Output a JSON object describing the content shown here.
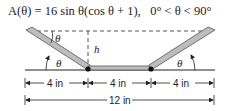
{
  "formula": {
    "lhs": "A(θ) = 16 sin θ(cos θ + 1),",
    "domain": "0° < θ < 90°"
  },
  "diagram": {
    "angle_label": "θ",
    "height_label": "h",
    "segments": [
      {
        "label": "4 in"
      },
      {
        "label": "4 in"
      },
      {
        "label": "4 in"
      }
    ],
    "total_label": "12 in"
  },
  "colors": {
    "board_fill": "#bdbdbd",
    "board_edge": "#555555",
    "line": "#222222"
  }
}
